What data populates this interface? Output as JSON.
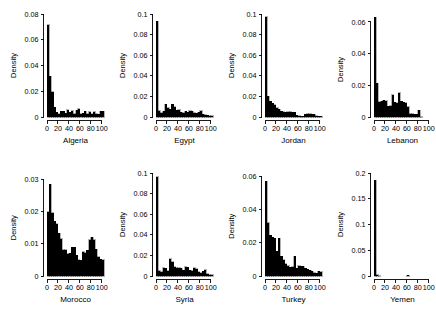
{
  "figure": {
    "background": "#ffffff",
    "foreground": "#000000",
    "rows": 2,
    "cols": 4,
    "shared_ylabel": "Density",
    "shared_xticks": [
      0,
      20,
      40,
      60,
      80,
      100
    ]
  },
  "chart_data": [
    {
      "type": "bar",
      "title": "",
      "xlabel": "Algeria",
      "ylabel": "Density",
      "xlim": [
        0,
        104
      ],
      "ylim": [
        0,
        0.08
      ],
      "xticks": [
        0,
        20,
        40,
        60,
        80,
        100
      ],
      "ytick_labels": [
        "0",
        "0.02",
        "0.04",
        "0.06",
        "0.08"
      ],
      "yticks": [
        0,
        0.02,
        0.04,
        0.06,
        0.08
      ],
      "grid": false,
      "bin_width": 4,
      "bin_starts": [
        0,
        4,
        8,
        12,
        16,
        20,
        24,
        28,
        32,
        36,
        40,
        44,
        48,
        52,
        56,
        60,
        64,
        68,
        72,
        76,
        80,
        84,
        88,
        92,
        96,
        100
      ],
      "values": [
        0.0715,
        0.0318,
        0.0195,
        0.0075,
        0.0038,
        0.0024,
        0.0043,
        0.0045,
        0.0028,
        0.0056,
        0.0036,
        0.0048,
        0.0026,
        0.0053,
        0.0063,
        0.0026,
        0.0031,
        0.0043,
        0.0025,
        0.0041,
        0.0027,
        0.004,
        0.0026,
        0.0022,
        0.0046,
        0.0043
      ]
    },
    {
      "type": "bar",
      "title": "",
      "xlabel": "Egypt",
      "ylabel": "Density",
      "xlim": [
        0,
        104
      ],
      "ylim": [
        0,
        0.1
      ],
      "xticks": [
        0,
        20,
        40,
        60,
        80,
        100
      ],
      "ytick_labels": [
        "0",
        "0.02",
        "0.04",
        "0.06",
        "0.08",
        "0.1"
      ],
      "yticks": [
        0,
        0.02,
        0.04,
        0.06,
        0.08,
        0.1
      ],
      "grid": false,
      "bin_width": 4,
      "bin_starts": [
        0,
        4,
        8,
        12,
        16,
        20,
        24,
        28,
        32,
        36,
        40,
        44,
        48,
        52,
        56,
        60,
        64,
        68,
        72,
        76,
        80,
        84,
        88,
        92,
        96,
        100
      ],
      "values": [
        0.093,
        0.0062,
        0.0043,
        0.0058,
        0.0126,
        0.0088,
        0.0073,
        0.0126,
        0.0101,
        0.0066,
        0.0072,
        0.0045,
        0.0043,
        0.0055,
        0.0046,
        0.006,
        0.0055,
        0.004,
        0.0037,
        0.0048,
        0.006,
        0.0028,
        0.0022,
        0.0016,
        0.0012,
        0.0014
      ]
    },
    {
      "type": "bar",
      "title": "",
      "xlabel": "Jordan",
      "ylabel": "Density",
      "xlim": [
        0,
        104
      ],
      "ylim": [
        0,
        0.1
      ],
      "xticks": [
        0,
        20,
        40,
        60,
        80,
        100
      ],
      "ytick_labels": [
        "0",
        "0.02",
        "0.04",
        "0.06",
        "0.08",
        "0.1"
      ],
      "yticks": [
        0,
        0.02,
        0.04,
        0.06,
        0.08,
        0.1
      ],
      "grid": false,
      "bin_width": 4,
      "bin_starts": [
        0,
        4,
        8,
        12,
        16,
        20,
        24,
        28,
        32,
        36,
        40,
        44,
        48,
        52,
        56,
        60,
        64,
        68,
        72,
        76,
        80,
        84,
        88,
        92,
        96,
        100
      ],
      "values": [
        0.0975,
        0.02,
        0.0155,
        0.0132,
        0.0118,
        0.0092,
        0.0074,
        0.0056,
        0.0053,
        0.0046,
        0.0052,
        0.005,
        0.0048,
        0.0044,
        0.0015,
        0.001,
        0.0008,
        0.0009,
        0.0028,
        0.003,
        0.0031,
        0.0028,
        0.0026,
        0.0012,
        0.0008,
        0.0006
      ]
    },
    {
      "type": "bar",
      "title": "",
      "xlabel": "Lebanon",
      "ylabel": "Density",
      "xlim": [
        0,
        104
      ],
      "ylim": [
        0,
        0.065
      ],
      "xticks": [
        0,
        20,
        40,
        60,
        80,
        100
      ],
      "ytick_labels": [
        "0",
        "0.02",
        "0.04",
        "0.06"
      ],
      "yticks": [
        0,
        0.02,
        0.04,
        0.06
      ],
      "grid": false,
      "bin_width": 4,
      "bin_starts": [
        0,
        4,
        8,
        12,
        16,
        20,
        24,
        28,
        32,
        36,
        40,
        44,
        48,
        52,
        56,
        60,
        64,
        68,
        72,
        76,
        80,
        84,
        88,
        92,
        96,
        100
      ],
      "values": [
        0.0628,
        0.0213,
        0.0097,
        0.0098,
        0.0105,
        0.0104,
        0.0069,
        0.007,
        0.0139,
        0.0093,
        0.009,
        0.0153,
        0.0098,
        0.0093,
        0.009,
        0.0065,
        0.0021,
        0.0021,
        0.0018,
        0.0016,
        0.0044,
        0.0001,
        0.0,
        0.0,
        0.0,
        0.0
      ]
    },
    {
      "type": "bar",
      "title": "",
      "xlabel": "Morocco",
      "ylabel": "Density",
      "xlim": [
        0,
        104
      ],
      "ylim": [
        0,
        0.032
      ],
      "xticks": [
        0,
        20,
        40,
        60,
        80,
        100
      ],
      "ytick_labels": [
        "0",
        "0.01",
        "0.02",
        "0.03"
      ],
      "yticks": [
        0,
        0.01,
        0.02,
        0.03
      ],
      "grid": false,
      "bin_width": 4,
      "bin_starts": [
        0,
        4,
        8,
        12,
        16,
        20,
        24,
        28,
        32,
        36,
        40,
        44,
        48,
        52,
        56,
        60,
        64,
        68,
        72,
        76,
        80,
        84,
        88,
        92,
        96,
        100
      ],
      "values": [
        0.02,
        0.0285,
        0.0197,
        0.017,
        0.0163,
        0.0133,
        0.0115,
        0.0082,
        0.0081,
        0.0069,
        0.007,
        0.009,
        0.0089,
        0.0065,
        0.005,
        0.0049,
        0.0075,
        0.0073,
        0.008,
        0.0113,
        0.012,
        0.0113,
        0.0083,
        0.006,
        0.0052,
        0.005
      ]
    },
    {
      "type": "bar",
      "title": "",
      "xlabel": "Syria",
      "ylabel": "Density",
      "xlim": [
        0,
        104
      ],
      "ylim": [
        0,
        0.1
      ],
      "xticks": [
        0,
        20,
        40,
        60,
        80,
        100
      ],
      "ytick_labels": [
        "0",
        "0.02",
        "0.04",
        "0.06",
        "0.08",
        "0.1"
      ],
      "yticks": [
        0,
        0.02,
        0.04,
        0.06,
        0.08,
        0.1
      ],
      "grid": false,
      "bin_width": 4,
      "bin_starts": [
        0,
        4,
        8,
        12,
        16,
        20,
        24,
        28,
        32,
        36,
        40,
        44,
        48,
        52,
        56,
        60,
        64,
        68,
        72,
        76,
        80,
        84,
        88,
        92,
        96,
        100
      ],
      "values": [
        0.0965,
        0.0053,
        0.0043,
        0.008,
        0.0075,
        0.0052,
        0.0168,
        0.014,
        0.0092,
        0.0078,
        0.008,
        0.0073,
        0.0057,
        0.0088,
        0.0085,
        0.0057,
        0.005,
        0.0078,
        0.0072,
        0.004,
        0.0032,
        0.0046,
        0.006,
        0.0022,
        0.0012,
        0.001
      ]
    },
    {
      "type": "bar",
      "title": "",
      "xlabel": "Turkey",
      "ylabel": "Density",
      "xlim": [
        0,
        104
      ],
      "ylim": [
        0,
        0.062
      ],
      "xticks": [
        0,
        20,
        40,
        60,
        80,
        100
      ],
      "ytick_labels": [
        "0",
        "0.02",
        "0.04",
        "0.06"
      ],
      "yticks": [
        0,
        0.02,
        0.04,
        0.06
      ],
      "grid": false,
      "bin_width": 4,
      "bin_starts": [
        0,
        4,
        8,
        12,
        16,
        20,
        24,
        28,
        32,
        36,
        40,
        44,
        48,
        52,
        56,
        60,
        64,
        68,
        72,
        76,
        80,
        84,
        88,
        92,
        96,
        100
      ],
      "values": [
        0.057,
        0.032,
        0.0245,
        0.0232,
        0.0228,
        0.0148,
        0.0227,
        0.012,
        0.0097,
        0.0073,
        0.0063,
        0.0052,
        0.0055,
        0.0119,
        0.0048,
        0.0062,
        0.006,
        0.0058,
        0.0046,
        0.0042,
        0.0035,
        0.0028,
        0.0021,
        0.0016,
        0.003,
        0.0025
      ]
    },
    {
      "type": "bar",
      "title": "",
      "xlabel": "Yemen",
      "ylabel": "Density",
      "xlim": [
        0,
        104
      ],
      "ylim": [
        0,
        0.2
      ],
      "xticks": [
        0,
        20,
        40,
        60,
        80,
        100
      ],
      "ytick_labels": [
        "0",
        "0.05",
        "0.1",
        "0.15",
        "0.2"
      ],
      "yticks": [
        0,
        0.05,
        0.1,
        0.15,
        0.2
      ],
      "grid": false,
      "bin_width": 4,
      "bin_starts": [
        0,
        4,
        8,
        12,
        16,
        20,
        24,
        28,
        32,
        36,
        40,
        44,
        48,
        52,
        56,
        60,
        64,
        68,
        72,
        76,
        80,
        84,
        88,
        92,
        96,
        100
      ],
      "values": [
        0.1855,
        0.0022,
        0.0008,
        0.0,
        0.0,
        0.0,
        0.0,
        0.0,
        0.0,
        0.0,
        0.0,
        0.0,
        0.0,
        0.0,
        0.0,
        0.0018,
        0.0,
        0.0,
        0.0,
        0.0,
        0.0,
        0.0,
        0.0,
        0.0,
        0.0,
        0.0
      ]
    }
  ]
}
